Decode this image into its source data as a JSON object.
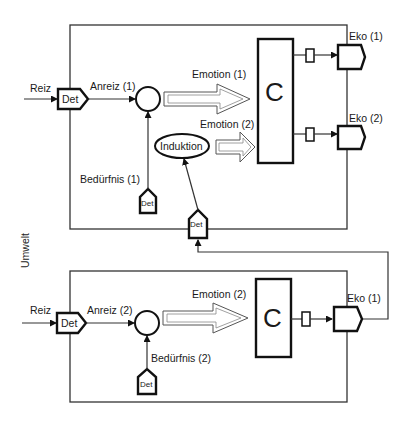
{
  "diagram": {
    "side_label": "Umwelt",
    "upper_system": {
      "input_label": "Reiz",
      "detector_label": "Det",
      "incentive_label": "Anreiz (1)",
      "need_label": "Bedürfnis (1)",
      "need_detector_label": "Det",
      "emotion_1_label": "Emotion (1)",
      "emotion_2_label": "Emotion (2)",
      "induction_label": "Induktion",
      "induction_detector_label": "Det",
      "controller_label": "C",
      "output_1_label": "Eko (1)",
      "output_2_label": "Eko (2)"
    },
    "lower_system": {
      "input_label": "Reiz",
      "detector_label": "Det",
      "incentive_label": "Anreiz (2)",
      "need_label": "Bedürfnis (2)",
      "need_detector_label": "Det",
      "emotion_label": "Emotion (2)",
      "controller_label": "C",
      "output_label": "Eko (1)"
    }
  }
}
